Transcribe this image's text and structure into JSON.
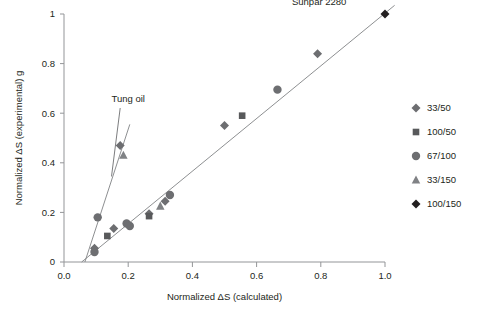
{
  "chart_data": {
    "type": "scatter",
    "title": "",
    "xlabel": "Normalized ΔS (calculated)",
    "ylabel": "Normalized ΔS (experimental) g",
    "xlim": [
      0.0,
      1.0
    ],
    "ylim": [
      0.0,
      1.0
    ],
    "xticks": [
      "0.0",
      "0.2",
      "0.4",
      "0.6",
      "0.8",
      "1.0"
    ],
    "xtick_values": [
      0.0,
      0.2,
      0.4,
      0.6,
      0.8,
      1.0
    ],
    "yticks": [
      "0",
      "0.2",
      "0.4",
      "0.6",
      "0.8",
      "1"
    ],
    "ytick_values": [
      0.0,
      0.2,
      0.4,
      0.6,
      0.8,
      1.0
    ],
    "grid": false,
    "legend_position": "right",
    "series": [
      {
        "name": "33/50",
        "marker": "diamond",
        "color": "#6d6e71",
        "points": [
          {
            "x": 0.095,
            "y": 0.055
          },
          {
            "x": 0.155,
            "y": 0.135
          },
          {
            "x": 0.175,
            "y": 0.47
          },
          {
            "x": 0.265,
            "y": 0.195
          },
          {
            "x": 0.315,
            "y": 0.245
          },
          {
            "x": 0.5,
            "y": 0.55
          },
          {
            "x": 0.79,
            "y": 0.84
          }
        ]
      },
      {
        "name": "100/50",
        "marker": "square",
        "color": "#58595b",
        "points": [
          {
            "x": 0.135,
            "y": 0.105
          },
          {
            "x": 0.265,
            "y": 0.185
          },
          {
            "x": 0.555,
            "y": 0.59
          }
        ]
      },
      {
        "name": "67/100",
        "marker": "circle",
        "color": "#6d6e71",
        "points": [
          {
            "x": 0.095,
            "y": 0.04
          },
          {
            "x": 0.105,
            "y": 0.18
          },
          {
            "x": 0.195,
            "y": 0.155
          },
          {
            "x": 0.205,
            "y": 0.145
          },
          {
            "x": 0.33,
            "y": 0.27
          },
          {
            "x": 0.665,
            "y": 0.695
          }
        ]
      },
      {
        "name": "33/150",
        "marker": "triangle",
        "color": "#808285",
        "points": [
          {
            "x": 0.185,
            "y": 0.43
          },
          {
            "x": 0.3,
            "y": 0.225
          }
        ]
      },
      {
        "name": "100/150",
        "marker": "diamond",
        "color": "#231f20",
        "points": [
          {
            "x": 1.0,
            "y": 1.0
          }
        ]
      }
    ],
    "trendlines": [
      {
        "name": "tung-oil-line",
        "x1": 0.065,
        "y1": 0.0,
        "x2": 0.205,
        "y2": 0.555
      },
      {
        "name": "main-line",
        "x1": 0.055,
        "y1": 0.0,
        "x2": 1.03,
        "y2": 1.035
      }
    ],
    "annotations": [
      {
        "name": "tung-oil",
        "text": "Tung oil",
        "x": 0.2,
        "y": 0.645
      },
      {
        "name": "sunpar",
        "text": "Sunpar 2280",
        "x": 0.795,
        "y": 1.035
      }
    ]
  }
}
